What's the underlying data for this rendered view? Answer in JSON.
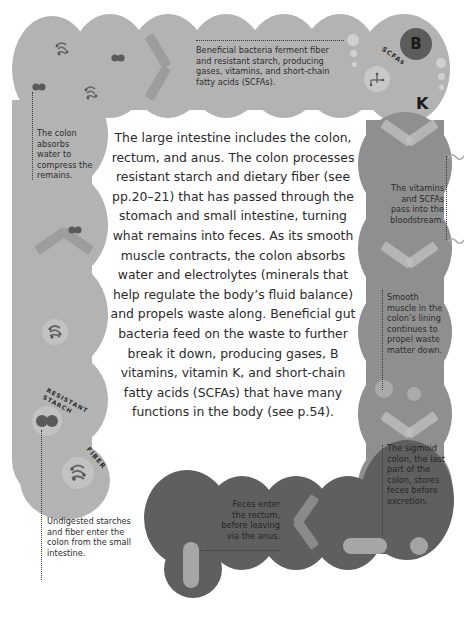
{
  "main_text": "The large intestine includes the colon, rectum, and anus. The colon processes resistant starch and dietary fiber (see pp.20–21) that has passed through the stomach and small intestine, turning what remains into feces. As its smooth muscle contracts, the colon absorbs water and electrolytes (minerals that help regulate the body’s fluid balance) and propels waste along. Beneficial gut bacteria feed on the waste to further break it down, producing gases, B vitamins, vitamin K, and short-chain fatty acids (SCFAs) that have many functions in the body (see p.54).",
  "annotations": {
    "fermentation": "Beneficial bacteria ferment fiber and resistant starch, producing gases, vitamins, and short-chain fatty acids (SCFAs).",
    "absorbs_water": "The colon absorbs water to compress the remains.",
    "bloodstream": "The vitamins and SCFAs pass into the bloodstream.",
    "smooth_muscle": "Smooth muscle in the colon’s lining continues to propel waste matter down.",
    "sigmoid": "The sigmoid colon, the last part of the colon, stores feces before excretion.",
    "rectum": "Feces enter the rectum, before leaving via the anus.",
    "entry": "Undigested starches and fiber enter the colon from the small intestine."
  },
  "icon_labels": {
    "resistant_starch": "RESISTANT STARCH",
    "fiber": "FIBER",
    "scfas": "SCFAs",
    "vitamin_b": "B",
    "vitamin_k": "K"
  },
  "colors": {
    "ascending_transverse": "#b3b3b3",
    "descending": "#8f8f8f",
    "rectum": "#5f5f5f",
    "text": "#2b2b2b"
  }
}
